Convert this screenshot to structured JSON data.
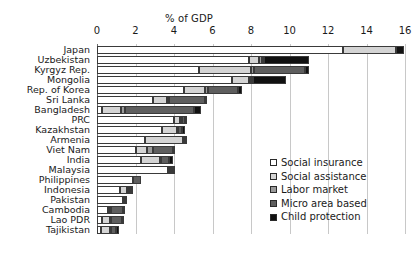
{
  "chart_data": {
    "type": "bar",
    "orientation": "horizontal",
    "stacked": true,
    "title": "",
    "xlabel": "% of GDP",
    "ylabel": "",
    "xlim": [
      0,
      16
    ],
    "xticks": [
      0,
      2,
      4,
      6,
      8,
      10,
      12,
      14,
      16
    ],
    "xtick_labels": [
      "0",
      "2",
      "4",
      "6",
      "8",
      "10",
      "12",
      "14",
      "16"
    ],
    "grid": true,
    "legend_position": "inside-bottom-right",
    "categories": [
      "Japan",
      "Uzbekistan",
      "Kyrgyz Rep.",
      "Mongolia",
      "Rep. of Korea",
      "Sri Lanka",
      "Bangladesh",
      "PRC",
      "Kazakhstan",
      "Armenia",
      "Viet Nam",
      "India",
      "Malaysia",
      "Philippines",
      "Indonesia",
      "Pakistan",
      "Cambodia",
      "Lao PDR",
      "Tajikistan"
    ],
    "series": [
      {
        "name": "Social insurance",
        "color": "#ffffff",
        "values": [
          12.8,
          7.9,
          5.3,
          7.0,
          4.5,
          2.9,
          0.25,
          4.0,
          3.4,
          2.5,
          2.0,
          2.3,
          3.7,
          1.85,
          1.2,
          1.35,
          0.55,
          0.25,
          0.2
        ]
      },
      {
        "name": "Social assistance",
        "color": "#d4d4d4",
        "values": [
          2.75,
          0.5,
          2.7,
          0.9,
          1.1,
          0.75,
          1.0,
          0.3,
          0.75,
          1.95,
          0.6,
          0.95,
          0.1,
          0.0,
          0.35,
          0.05,
          0.15,
          0.45,
          0.45
        ]
      },
      {
        "name": "Labor market",
        "color": "#9a9a9a",
        "values": [
          0.0,
          0.15,
          0.15,
          0.1,
          0.15,
          0.1,
          0.2,
          0.1,
          0.05,
          0.05,
          0.3,
          0.1,
          0.05,
          0.0,
          0.1,
          0.0,
          0.05,
          0.05,
          0.1
        ]
      },
      {
        "name": "Micro area based",
        "color": "#5e5e5e",
        "values": [
          0.0,
          0.1,
          2.65,
          0.1,
          1.6,
          1.85,
          3.6,
          0.15,
          0.2,
          0.05,
          1.05,
          0.4,
          0.1,
          0.45,
          0.1,
          0.05,
          0.6,
          0.55,
          0.25
        ]
      },
      {
        "name": "Child protection",
        "color": "#111111",
        "values": [
          0.4,
          2.35,
          0.2,
          1.7,
          0.2,
          0.05,
          0.35,
          0.05,
          0.15,
          0.05,
          0.1,
          0.2,
          0.1,
          0.0,
          0.1,
          0.1,
          0.1,
          0.1,
          0.15
        ]
      }
    ],
    "totals": [
      15.95,
      11.0,
      11.0,
      9.8,
      7.55,
      5.65,
      5.4,
      4.6,
      4.55,
      4.6,
      4.05,
      3.95,
      4.05,
      2.3,
      1.85,
      1.55,
      1.45,
      1.4,
      1.15
    ]
  },
  "legend": {
    "items": [
      {
        "label": "Social insurance"
      },
      {
        "label": "Social assistance"
      },
      {
        "label": "Labor market"
      },
      {
        "label": "Micro area based"
      },
      {
        "label": "Child protection"
      }
    ]
  }
}
